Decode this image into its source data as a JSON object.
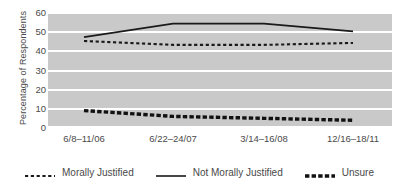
{
  "chart_data": {
    "type": "line",
    "title": "",
    "xlabel": "",
    "ylabel": "Percentage of Respondents",
    "categories": [
      "6/8–11/06",
      "6/22–24/07",
      "3/14–16/08",
      "12/16–18/11"
    ],
    "yticks": [
      "0",
      "10",
      "20",
      "30",
      "40",
      "50",
      "60"
    ],
    "ylim": [
      0,
      60
    ],
    "grid": true,
    "legend_position": "bottom",
    "plot_background": "#c9c9c9",
    "gridline_color": "#ffffff",
    "line_color": "#1a1a1a",
    "series": [
      {
        "name": "Morally Justified",
        "style": "dotted",
        "values": [
          45,
          43,
          43,
          44
        ]
      },
      {
        "name": "Not Morally Justified",
        "style": "solid",
        "values": [
          47,
          54,
          54,
          50
        ]
      },
      {
        "name": "Unsure",
        "style": "thick-dashed",
        "values": [
          9,
          6,
          5,
          4
        ]
      }
    ]
  },
  "axis": {
    "ylabel": "Percentage of Respondents",
    "yticks": [
      "60",
      "50",
      "40",
      "30",
      "20",
      "10",
      "0"
    ],
    "xticks": [
      "6/8–11/06",
      "6/22–24/07",
      "3/14–16/08",
      "12/16–18/11"
    ]
  },
  "legend": {
    "items": [
      {
        "label": "Morally Justified",
        "style": "dotted"
      },
      {
        "label": "Not Morally Justified",
        "style": "solid"
      },
      {
        "label": "Unsure",
        "style": "thick-dashed"
      }
    ]
  }
}
